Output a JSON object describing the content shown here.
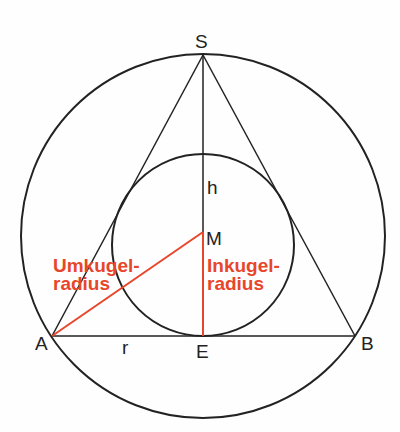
{
  "diagram": {
    "colors": {
      "line": "#222222",
      "accent": "#e8462a",
      "background": "#fefefe"
    },
    "points": {
      "S": "S",
      "M": "M",
      "A": "A",
      "B": "B",
      "E": "E"
    },
    "segments": {
      "h": "h",
      "r": "r"
    },
    "labels": {
      "umkugel_line1": "Umkugel-",
      "umkugel_line2": "radius",
      "inkugel_line1": "Inkugel-",
      "inkugel_line2": "radius"
    }
  }
}
